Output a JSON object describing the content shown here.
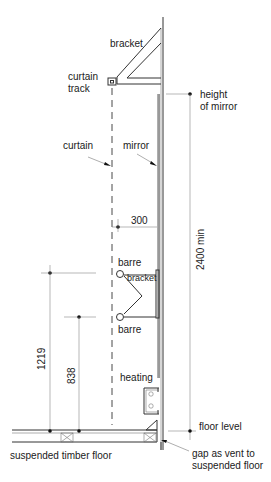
{
  "diagram": {
    "labels": {
      "bracket_top": "bracket",
      "curtain_track_line1": "curtain",
      "curtain_track_line2": "track",
      "height_of_mirror_line1": "height",
      "height_of_mirror_line2": "of mirror",
      "curtain": "curtain",
      "mirror": "mirror",
      "barre_upper": "barre",
      "barre_bracket": "bracket",
      "barre_lower": "barre",
      "heating": "heating",
      "floor_level": "floor level",
      "suspended_timber_floor": "suspended timber floor",
      "gap_vent_line1": "gap as vent to",
      "gap_vent_line2": "suspended floor"
    },
    "dimensions": {
      "curtain_to_mirror": "300",
      "min_height": "2400 min",
      "upper_barre_height": "1219",
      "lower_barre_height": "838"
    }
  }
}
